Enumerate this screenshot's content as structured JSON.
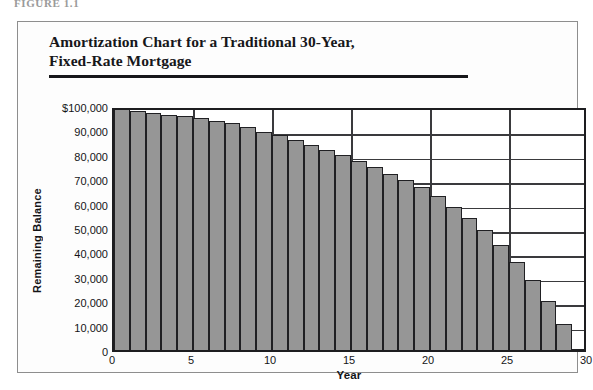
{
  "figure": {
    "caption_fragment": "FIGURE 1.1",
    "title_line1": "Amortization Chart for a Traditional 30-Year,",
    "title_line2": "Fixed-Rate Mortgage"
  },
  "colors": {
    "bar_fill": "#969696",
    "bar_outline": "#202023",
    "axis": "#1d1d20",
    "grid": "#3a3a3d",
    "text": "#141417",
    "panel_border": "#8e8e8e"
  },
  "chart_data": {
    "type": "bar",
    "title": "Amortization Chart for a Traditional 30-Year, Fixed-Rate Mortgage",
    "xlabel": "Year",
    "ylabel": "Remaining Balance",
    "xlim": [
      0,
      30
    ],
    "ylim": [
      0,
      100000
    ],
    "grid": true,
    "legend": "none",
    "x_tick_labels": [
      "0",
      "5",
      "10",
      "15",
      "20",
      "25",
      "30"
    ],
    "x_tick_values": [
      0,
      5,
      10,
      15,
      20,
      25,
      30
    ],
    "y_tick_labels": [
      "$100,000",
      "90,000",
      "80,000",
      "70,000",
      "60,000",
      "50,000",
      "40,000",
      "30,000",
      "20,000",
      "10,000",
      "0"
    ],
    "y_tick_values": [
      100000,
      90000,
      80000,
      70000,
      60000,
      50000,
      40000,
      30000,
      20000,
      10000,
      0
    ],
    "categories": [
      1,
      2,
      3,
      4,
      5,
      6,
      7,
      8,
      9,
      10,
      11,
      12,
      13,
      14,
      15,
      16,
      17,
      18,
      19,
      20,
      21,
      22,
      23,
      24,
      25,
      26,
      27,
      28,
      29,
      30
    ],
    "values": [
      99000,
      98000,
      97000,
      96500,
      96000,
      95000,
      94000,
      93000,
      91500,
      89500,
      88000,
      86000,
      84000,
      82000,
      80000,
      77500,
      75000,
      72000,
      69500,
      67000,
      63000,
      58500,
      54000,
      49000,
      43000,
      36000,
      28500,
      20000,
      10500,
      0
    ]
  }
}
